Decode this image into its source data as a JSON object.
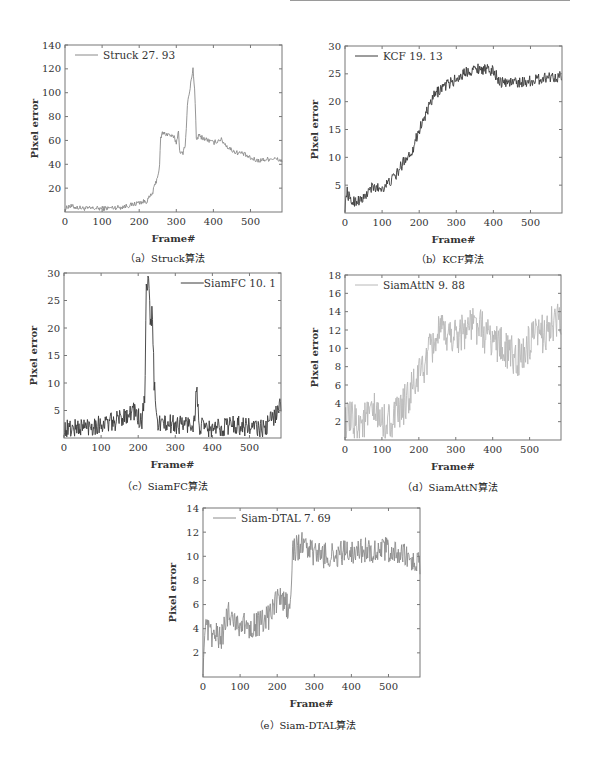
{
  "figure": {
    "header_rule": true,
    "panels": [
      {
        "id": "a",
        "caption": "（a）Struck算法",
        "legend": "Struck 27. 93",
        "legend_pos": "top-left"
      },
      {
        "id": "b",
        "caption": "（b）KCF算法",
        "legend": "KCF 19. 13",
        "legend_pos": "top-left"
      },
      {
        "id": "c",
        "caption": "（c）SiamFC算法",
        "legend": "SiamFC 10. 1",
        "legend_pos": "top-right"
      },
      {
        "id": "d",
        "caption": "（d）SiamAttN算法",
        "legend": "SiamAttN  9. 88",
        "legend_pos": "top-left"
      },
      {
        "id": "e",
        "caption": "（e）Siam-DTAL算法",
        "legend": "Siam-DTAL 7. 69",
        "legend_pos": "top-left"
      }
    ]
  },
  "chart_data": [
    {
      "type": "line",
      "title": "（a）Struck算法",
      "xlabel": "Frame#",
      "ylabel": "Pixel error",
      "xlim": [
        0,
        585
      ],
      "ylim": [
        0,
        140
      ],
      "xticks": [
        0,
        100,
        200,
        300,
        400,
        500
      ],
      "yticks": [
        20,
        40,
        60,
        80,
        100,
        120,
        140
      ],
      "grid": false,
      "legend_position": "upper left",
      "series": [
        {
          "name": "Struck 27. 93",
          "color": "#8a8a8a",
          "noise": 2.0,
          "keypoints": [
            [
              0,
              2
            ],
            [
              10,
              5
            ],
            [
              50,
              3
            ],
            [
              100,
              3
            ],
            [
              150,
              4
            ],
            [
              180,
              6
            ],
            [
              200,
              8
            ],
            [
              220,
              9
            ],
            [
              235,
              15
            ],
            [
              248,
              28
            ],
            [
              255,
              38
            ],
            [
              258,
              62
            ],
            [
              262,
              66
            ],
            [
              280,
              65
            ],
            [
              295,
              62
            ],
            [
              300,
              58
            ],
            [
              306,
              68
            ],
            [
              310,
              48
            ],
            [
              318,
              50
            ],
            [
              325,
              58
            ],
            [
              330,
              90
            ],
            [
              338,
              105
            ],
            [
              345,
              121
            ],
            [
              350,
              100
            ],
            [
              354,
              60
            ],
            [
              360,
              64
            ],
            [
              380,
              61
            ],
            [
              400,
              58
            ],
            [
              420,
              61
            ],
            [
              440,
              54
            ],
            [
              460,
              50
            ],
            [
              480,
              49
            ],
            [
              500,
              45
            ],
            [
              520,
              43
            ],
            [
              540,
              44
            ],
            [
              560,
              45
            ],
            [
              585,
              43
            ]
          ]
        }
      ]
    },
    {
      "type": "line",
      "title": "（b）KCF算法",
      "xlabel": "Frame#",
      "ylabel": "Pixel error",
      "xlim": [
        0,
        585
      ],
      "ylim": [
        0,
        30
      ],
      "xticks": [
        0,
        100,
        200,
        300,
        400,
        500
      ],
      "yticks": [
        5,
        10,
        15,
        20,
        25,
        30
      ],
      "grid": false,
      "legend_position": "upper left",
      "series": [
        {
          "name": "KCF 19. 13",
          "color": "#3a3a3a",
          "noise": 1.0,
          "keypoints": [
            [
              0,
              1
            ],
            [
              5,
              4
            ],
            [
              15,
              2
            ],
            [
              50,
              2.5
            ],
            [
              70,
              4.5
            ],
            [
              100,
              4.5
            ],
            [
              120,
              5.5
            ],
            [
              140,
              7
            ],
            [
              160,
              9.5
            ],
            [
              180,
              11
            ],
            [
              200,
              15
            ],
            [
              220,
              18
            ],
            [
              240,
              21
            ],
            [
              260,
              22.5
            ],
            [
              300,
              24
            ],
            [
              330,
              25.5
            ],
            [
              360,
              26
            ],
            [
              400,
              25.5
            ],
            [
              420,
              23.5
            ],
            [
              450,
              23.5
            ],
            [
              480,
              23.5
            ],
            [
              520,
              24
            ],
            [
              550,
              24.5
            ],
            [
              585,
              24.5
            ]
          ]
        }
      ]
    },
    {
      "type": "line",
      "title": "（c）SiamFC算法",
      "xlabel": "Frame#",
      "ylabel": "Pixel error",
      "xlim": [
        0,
        585
      ],
      "ylim": [
        0,
        30
      ],
      "xticks": [
        0,
        100,
        200,
        300,
        400,
        500
      ],
      "yticks": [
        5,
        10,
        15,
        20,
        25,
        30
      ],
      "grid": false,
      "legend_position": "upper right",
      "series": [
        {
          "name": "SiamFC 10. 1",
          "color": "#3a3a3a",
          "noise": 1.8,
          "keypoints": [
            [
              0,
              1.5
            ],
            [
              50,
              2
            ],
            [
              100,
              2.5
            ],
            [
              140,
              3
            ],
            [
              170,
              4.5
            ],
            [
              190,
              5
            ],
            [
              210,
              2.5
            ],
            [
              218,
              8
            ],
            [
              222,
              27
            ],
            [
              228,
              28
            ],
            [
              234,
              20
            ],
            [
              238,
              24
            ],
            [
              243,
              10
            ],
            [
              250,
              3
            ],
            [
              270,
              2.5
            ],
            [
              300,
              2.5
            ],
            [
              350,
              2.5
            ],
            [
              358,
              9
            ],
            [
              364,
              2
            ],
            [
              400,
              1.5
            ],
            [
              450,
              2.5
            ],
            [
              500,
              2
            ],
            [
              540,
              1.5
            ],
            [
              560,
              3.5
            ],
            [
              585,
              6
            ]
          ]
        }
      ]
    },
    {
      "type": "line",
      "title": "（d）SiamAttN算法",
      "xlabel": "Frame#",
      "ylabel": "Pixel error",
      "xlim": [
        0,
        585
      ],
      "ylim": [
        0,
        18
      ],
      "xticks": [
        0,
        100,
        200,
        300,
        400,
        500
      ],
      "yticks": [
        2,
        4,
        6,
        8,
        10,
        12,
        14,
        16,
        18
      ],
      "grid": false,
      "legend_position": "upper left",
      "series": [
        {
          "name": "SiamAttN  9. 88",
          "color": "#b8b8b8",
          "noise": 2.2,
          "keypoints": [
            [
              0,
              2
            ],
            [
              50,
              2
            ],
            [
              80,
              3
            ],
            [
              100,
              1.8
            ],
            [
              140,
              2.5
            ],
            [
              170,
              4.5
            ],
            [
              200,
              7
            ],
            [
              230,
              9.5
            ],
            [
              250,
              11.5
            ],
            [
              300,
              11.5
            ],
            [
              340,
              12.5
            ],
            [
              360,
              12.5
            ],
            [
              380,
              11.5
            ],
            [
              400,
              11
            ],
            [
              420,
              10.5
            ],
            [
              440,
              9.5
            ],
            [
              460,
              9
            ],
            [
              480,
              9
            ],
            [
              500,
              10.5
            ],
            [
              530,
              11.5
            ],
            [
              560,
              12.5
            ],
            [
              585,
              13
            ]
          ]
        }
      ]
    },
    {
      "type": "line",
      "title": "（e）Siam-DTAL算法",
      "xlabel": "Frame#",
      "ylabel": "Pixel error",
      "xlim": [
        0,
        585
      ],
      "ylim": [
        0,
        14
      ],
      "xticks": [
        0,
        100,
        200,
        300,
        400,
        500
      ],
      "yticks": [
        2,
        4,
        6,
        8,
        10,
        12,
        14
      ],
      "grid": false,
      "legend_position": "upper left",
      "series": [
        {
          "name": "Siam-DTAL 7. 69",
          "color": "#8c8c8c",
          "noise": 1.1,
          "keypoints": [
            [
              0,
              1
            ],
            [
              5,
              4
            ],
            [
              20,
              3.5
            ],
            [
              50,
              3.3
            ],
            [
              70,
              5.5
            ],
            [
              90,
              4.5
            ],
            [
              120,
              4.2
            ],
            [
              160,
              4.5
            ],
            [
              180,
              5
            ],
            [
              200,
              6.5
            ],
            [
              220,
              6.2
            ],
            [
              235,
              5.5
            ],
            [
              242,
              10.5
            ],
            [
              270,
              11
            ],
            [
              300,
              10.2
            ],
            [
              350,
              10
            ],
            [
              400,
              10.5
            ],
            [
              450,
              10.5
            ],
            [
              500,
              10.5
            ],
            [
              540,
              10
            ],
            [
              585,
              9.3
            ]
          ]
        }
      ]
    }
  ]
}
